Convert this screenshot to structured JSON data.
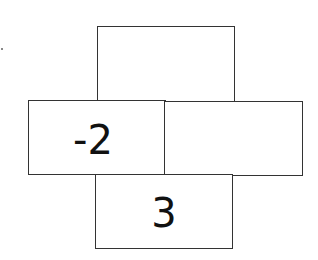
{
  "diagram": {
    "type": "cross-shaped number boxes",
    "cells": {
      "top": "",
      "left": "-2",
      "right": "",
      "bottom": "3"
    },
    "colors": {
      "border": "#333333",
      "text": "#111111",
      "background": "#ffffff"
    }
  }
}
